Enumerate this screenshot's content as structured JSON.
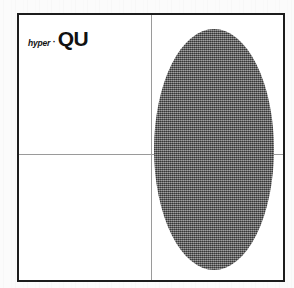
{
  "page": {
    "background_color": "#fbfbfb",
    "width": 294,
    "height": 288
  },
  "frame": {
    "border_color": "#1c1c1c",
    "border_width_px": 2,
    "fill_color": "#ffffff",
    "x": 17,
    "y": 13,
    "width": 268,
    "height": 269
  },
  "rules": {
    "color": "#9a9a9a",
    "vertical": {
      "x_page": 149,
      "x_frame": 132
    },
    "horizontal": {
      "y_page": 152,
      "y_frame": 139
    }
  },
  "wordmark": {
    "prefix": "hyper",
    "separator": "·",
    "name": "QU",
    "color": "#111111"
  },
  "shape": {
    "kind": "ellipse",
    "fill_color": "#6a6a6a",
    "texture": "halftone-dither",
    "center_x_page": 195,
    "center_y_page": 147,
    "radius_x": 60,
    "radius_y": 120
  }
}
